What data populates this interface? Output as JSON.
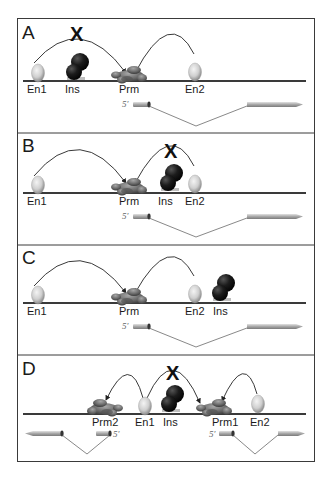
{
  "figure": {
    "panels": [
      {
        "letter": "A",
        "labels": {
          "en1": "En1",
          "ins": "Ins",
          "prm": "Prm",
          "en2": "En2"
        },
        "five_prime": "5′",
        "blocked_mark": "X",
        "description": "Insulator between En1 and Prm blocks En1; En2 activates Prm"
      },
      {
        "letter": "B",
        "labels": {
          "en1": "En1",
          "prm": "Prm",
          "ins": "Ins",
          "en2": "En2"
        },
        "five_prime": "5′",
        "blocked_mark": "X",
        "description": "Insulator between Prm and En2 blocks En2; En1 activates Prm"
      },
      {
        "letter": "C",
        "labels": {
          "en1": "En1",
          "prm": "Prm",
          "en2": "En2",
          "ins": "Ins"
        },
        "five_prime": "5′",
        "description": "Insulator outside En2; both En1 and En2 activate Prm"
      },
      {
        "letter": "D",
        "labels": {
          "prm2": "Prm2",
          "en1": "En1",
          "ins": "Ins",
          "prm1": "Prm1",
          "en2": "En2"
        },
        "five_prime_left": "5′",
        "five_prime_right": "5′",
        "blocked_mark": "X",
        "description": "Divergent promoters; Ins blocks En1 from Prm1; En1 activates Prm2, En2 activates Prm1"
      }
    ],
    "colors": {
      "dna_line": "#3a3a3a",
      "insulator": "#151515",
      "enhancer": "#d8d8d8",
      "promoter_complex": "#6e6e6e",
      "exon_arrow": "#a8a8a8",
      "frame": "#3a3a3a"
    }
  }
}
